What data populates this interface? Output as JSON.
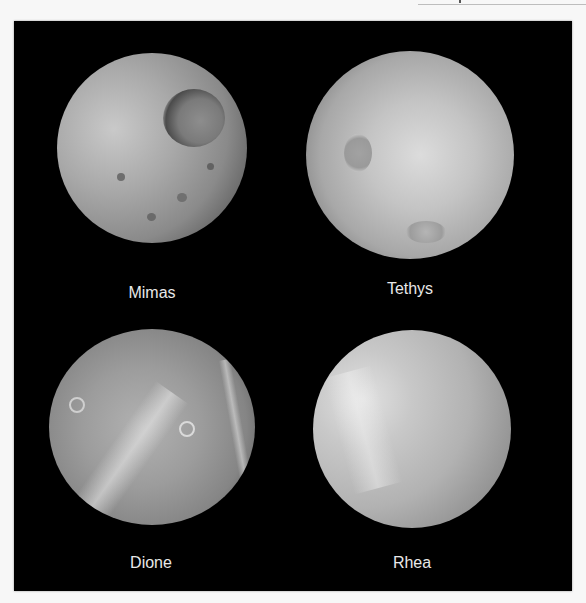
{
  "figure": {
    "background": "#000000",
    "moons": [
      {
        "name": "Mimas",
        "label": "Mimas"
      },
      {
        "name": "Tethys",
        "label": "Tethys"
      },
      {
        "name": "Dione",
        "label": "Dione"
      },
      {
        "name": "Rhea",
        "label": "Rhea"
      }
    ]
  }
}
